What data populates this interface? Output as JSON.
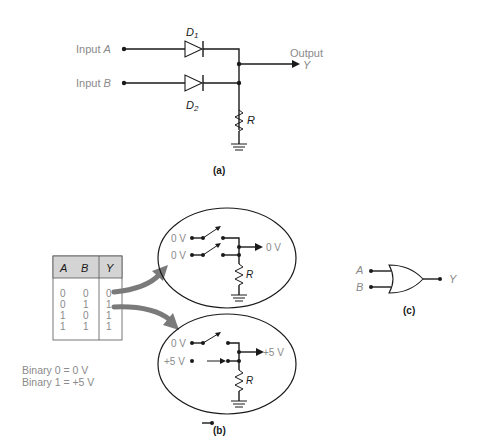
{
  "figure_a": {
    "input_a_label": "Input ",
    "input_a_var": "A",
    "input_b_label": "Input ",
    "input_b_var": "B",
    "d1_letter": "D",
    "d1_sub": "1",
    "d2_letter": "D",
    "d2_sub": "2",
    "output_label": "Output",
    "output_var": "Y",
    "resistor_label": "R",
    "caption": "(a)"
  },
  "figure_b": {
    "truth_table": {
      "headers": [
        "A",
        "B",
        "Y"
      ],
      "rows": [
        [
          "0",
          "0",
          "0"
        ],
        [
          "0",
          "1",
          "1"
        ],
        [
          "1",
          "0",
          "1"
        ],
        [
          "1",
          "1",
          "1"
        ]
      ],
      "header_bg": "#d4d4d4"
    },
    "legend": {
      "line1": "Binary 0 = 0 V",
      "line2": "Binary 1 = +5 V"
    },
    "top_circuit": {
      "in1": "0 V",
      "in2": "0 V",
      "out": "0 V",
      "resistor_label": "R"
    },
    "bottom_circuit": {
      "in1": "0 V",
      "in2": "+5 V",
      "out": "+5 V",
      "resistor_label": "R"
    },
    "arrow_color": "#7a7a7a",
    "caption": "(b)"
  },
  "figure_c": {
    "input_a": "A",
    "input_b": "B",
    "output": "Y",
    "caption": "(c)"
  }
}
